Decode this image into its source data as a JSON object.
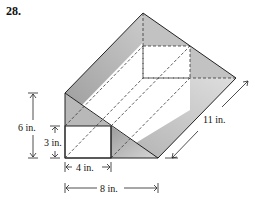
{
  "problem": {
    "number": "28."
  },
  "diagram": {
    "type": "triangular prism with rectangular channel removed",
    "colors": {
      "face_dark": "#a8a8a8",
      "face_mid": "#c4c4c4",
      "face_light": "#d8d8d8",
      "edge": "#222222",
      "hidden_edge": "#333333"
    },
    "labels": {
      "height_total": "6 in.",
      "height_square": "3 in.",
      "width_square": "4 in.",
      "width_total": "8 in.",
      "length": "11 in."
    }
  }
}
